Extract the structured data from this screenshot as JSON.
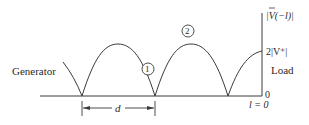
{
  "diagram": {
    "type": "standing-wave-voltage-magnitude",
    "labels": {
      "generator": "Generator",
      "load": "Load",
      "axis_title": "|V(−l)|",
      "axis_title_bar": "V",
      "axis_max": "2|V⁺|",
      "axis_zero": "0",
      "position": "l = 0",
      "spacing": "d",
      "marker_1": "1",
      "marker_2": "2"
    },
    "colors": {
      "line": "#3a3a3a",
      "text": "#2a2a2a",
      "background": "#ffffff"
    }
  }
}
